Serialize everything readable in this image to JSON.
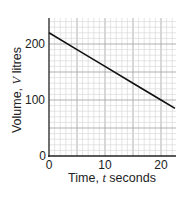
{
  "chart_data": {
    "type": "line",
    "title": "",
    "xlabel": "Time, t seconds",
    "ylabel": "Volume, V litres",
    "xlim": [
      0,
      22.5
    ],
    "ylim": [
      0,
      240
    ],
    "xticks": [
      0,
      10,
      20
    ],
    "yticks": [
      0,
      100,
      200
    ],
    "grid": true,
    "legend": null,
    "series": [
      {
        "name": "V",
        "x": [
          0,
          5,
          10,
          15,
          20,
          22.5
        ],
        "y": [
          220,
          190,
          160,
          130,
          100,
          85
        ]
      }
    ]
  },
  "labels": {
    "x_axis": "Time, t seconds",
    "x_axis_prefix": "Time, ",
    "x_axis_var": "t",
    "x_axis_suffix": " seconds",
    "y_axis_prefix": "Volume, ",
    "y_axis_var": "V",
    "y_axis_suffix": " litres",
    "xtick_0": "0",
    "xtick_10": "10",
    "xtick_20": "20",
    "ytick_0": "0",
    "ytick_100": "100",
    "ytick_200": "200"
  },
  "colors": {
    "grid_minor": "#d4d4d4",
    "grid_major": "#a8a8a8",
    "axis": "#222222",
    "line": "#111111"
  }
}
